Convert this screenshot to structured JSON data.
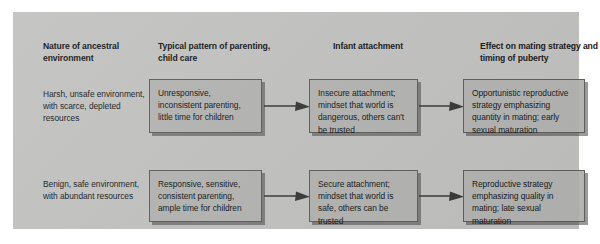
{
  "figure": {
    "panel_color": "#c2c3c1",
    "box_color": "#b4b5b3",
    "box_border_color": "#5e5f5d",
    "text_color": "#17181a"
  },
  "columns": [
    {
      "id": "environment",
      "header": "Nature of ancestral environment"
    },
    {
      "id": "parenting",
      "header": "Typical pattern of parenting, child care"
    },
    {
      "id": "attachment",
      "header": "Infant attachment"
    },
    {
      "id": "mating_strategy",
      "header": "Effect on mating strategy and timing of puberty"
    }
  ],
  "rows": [
    {
      "id": "harsh",
      "environment": "Harsh, unsafe environment, with scarce, depleted resources",
      "parenting": "Unresponsive, inconsistent parenting, little time for children",
      "attachment": "Insecure attachment; mindset that world is dangerous, others can't be trusted",
      "mating_strategy": "Opportunistic reproductive strategy emphasizing quantity in mating; early sexual maturation"
    },
    {
      "id": "benign",
      "environment": "Benign, safe environment, with abundant resources",
      "parenting": "Responsive, sensitive, consistent parenting, ample time for children",
      "attachment": "Secure attachment; mindset that world is safe, others can be trusted",
      "mating_strategy": "Reproductive strategy emphasizing quality in mating; late sexual maturation"
    }
  ],
  "arrows": [
    {
      "id": "harsh-parenting-to-attachment",
      "from": "parenting",
      "to": "attachment",
      "direction": "right"
    },
    {
      "id": "harsh-attachment-to-mating",
      "from": "attachment",
      "to": "mating_strategy",
      "direction": "right"
    },
    {
      "id": "benign-parenting-to-attachment",
      "from": "parenting",
      "to": "attachment",
      "direction": "right"
    },
    {
      "id": "benign-attachment-to-mating",
      "from": "attachment",
      "to": "mating_strategy",
      "direction": "right"
    }
  ]
}
